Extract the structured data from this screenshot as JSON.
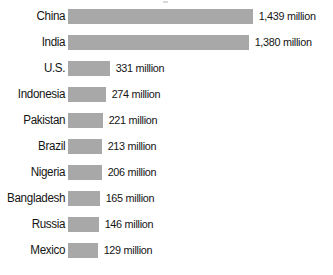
{
  "chart_data": {
    "type": "bar",
    "orientation": "horizontal",
    "title": "",
    "subtitle": "",
    "xlabel": "",
    "ylabel": "",
    "grid": false,
    "legend": null,
    "axis_visible": false,
    "value_unit": "million",
    "value_suffix": " million",
    "bar_color": "#a8a8a8",
    "background_color": "#ffffff",
    "text_color": "#141414",
    "categories": [
      "China",
      "India",
      "U.S.",
      "Indonesia",
      "Pakistan",
      "Brazil",
      "Nigeria",
      "Bangladesh",
      "Russia",
      "Mexico"
    ],
    "values": [
      1439,
      1380,
      331,
      274,
      221,
      213,
      206,
      165,
      146,
      129
    ],
    "value_labels": [
      "1,439 million",
      "1,380 million",
      "331 million",
      "274 million",
      "221 million",
      "213 million",
      "206 million",
      "165 million",
      "146 million",
      "129 million"
    ],
    "bars": [
      {
        "category": "China",
        "value": 1439,
        "value_label": "1,439 million",
        "bar_px": 185
      },
      {
        "category": "India",
        "value": 1380,
        "value_label": "1,380 million",
        "bar_px": 181
      },
      {
        "category": "U.S.",
        "value": 331,
        "value_label": "331 million",
        "bar_px": 42
      },
      {
        "category": "Indonesia",
        "value": 274,
        "value_label": "274 million",
        "bar_px": 38
      },
      {
        "category": "Pakistan",
        "value": 221,
        "value_label": "221 million",
        "bar_px": 35
      },
      {
        "category": "Brazil",
        "value": 213,
        "value_label": "213 million",
        "bar_px": 34
      },
      {
        "category": "Nigeria",
        "value": 206,
        "value_label": "206 million",
        "bar_px": 34
      },
      {
        "category": "Bangladesh",
        "value": 165,
        "value_label": "165 million",
        "bar_px": 32
      },
      {
        "category": "Russia",
        "value": 146,
        "value_label": "146 million",
        "bar_px": 31
      },
      {
        "category": "Mexico",
        "value": 129,
        "value_label": "129 million",
        "bar_px": 30
      }
    ]
  }
}
